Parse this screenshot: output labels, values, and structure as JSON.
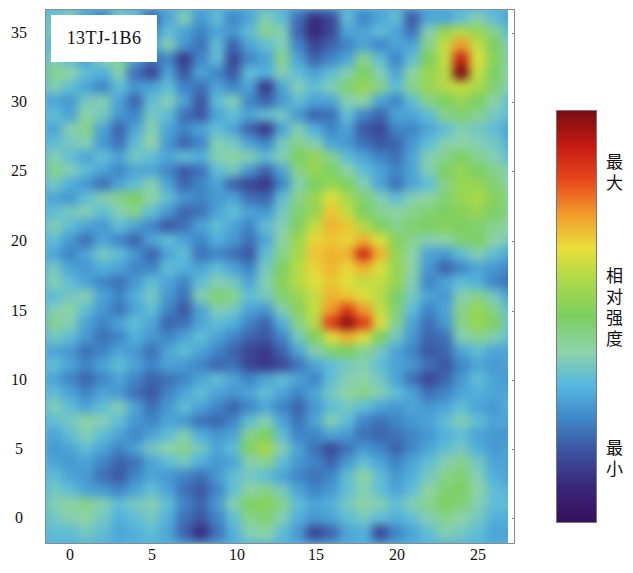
{
  "chart_data": {
    "type": "heatmap",
    "title": "13TJ-1B6",
    "xlabel": "",
    "ylabel": "",
    "x_ticks": [
      "0",
      "5",
      "10",
      "15",
      "20",
      "25"
    ],
    "y_ticks": [
      "35",
      "30",
      "25",
      "20",
      "15",
      "10",
      "5",
      "0"
    ],
    "xlim": [
      -1.5,
      26.8
    ],
    "ylim": [
      -1.8,
      36.7
    ],
    "grid": false,
    "colorbar": {
      "labels": [
        "最大",
        "相对强度",
        "最小"
      ],
      "max_label": "最大",
      "mid_label": "相对强度",
      "min_label": "最小",
      "colors": [
        "#7a0d12",
        "#c41a12",
        "#e8461a",
        "#f19a2c",
        "#e8e03a",
        "#a8d94a",
        "#7ccf62",
        "#8fd3a8",
        "#56b8e0",
        "#3f86c8",
        "#3b4f9e",
        "#3a2678",
        "#36105e"
      ]
    },
    "hotspots": [
      {
        "x": 17,
        "y": 17,
        "intensity": 0.95,
        "note": "main maximum"
      },
      {
        "x": 19,
        "y": 20,
        "intensity": 0.85
      },
      {
        "x": 25,
        "y": 31,
        "intensity": 1.0,
        "note": "top-right maximum"
      },
      {
        "x": 16.5,
        "y": 19.5,
        "intensity": 0.65,
        "note": "yellow-green halo region"
      }
    ],
    "grid_x_start": -1,
    "grid_y_start": 36,
    "grid_step": 1,
    "values": [
      [
        0.38,
        0.42,
        0.3,
        0.25,
        0.4,
        0.35,
        0.2,
        0.3,
        0.4,
        0.28,
        0.35,
        0.25,
        0.3,
        0.4,
        0.35,
        0.22,
        0.1,
        0.15,
        0.35,
        0.25,
        0.3,
        0.35,
        0.18,
        0.3,
        0.3,
        0.35,
        0.4,
        0.35,
        0.3
      ],
      [
        0.4,
        0.38,
        0.35,
        0.3,
        0.38,
        0.3,
        0.25,
        0.35,
        0.3,
        0.25,
        0.3,
        0.28,
        0.35,
        0.45,
        0.4,
        0.2,
        0.08,
        0.15,
        0.3,
        0.3,
        0.35,
        0.3,
        0.22,
        0.4,
        0.55,
        0.6,
        0.55,
        0.45,
        0.35
      ],
      [
        0.35,
        0.4,
        0.38,
        0.28,
        0.35,
        0.25,
        0.3,
        0.4,
        0.28,
        0.22,
        0.35,
        0.2,
        0.3,
        0.35,
        0.4,
        0.25,
        0.15,
        0.2,
        0.25,
        0.3,
        0.25,
        0.3,
        0.3,
        0.45,
        0.62,
        0.75,
        0.62,
        0.5,
        0.4
      ],
      [
        0.4,
        0.35,
        0.3,
        0.4,
        0.45,
        0.3,
        0.22,
        0.25,
        0.12,
        0.25,
        0.35,
        0.15,
        0.25,
        0.3,
        0.45,
        0.3,
        0.2,
        0.25,
        0.3,
        0.45,
        0.35,
        0.25,
        0.35,
        0.5,
        0.62,
        0.9,
        0.65,
        0.52,
        0.4
      ],
      [
        0.45,
        0.42,
        0.35,
        0.32,
        0.4,
        0.22,
        0.15,
        0.3,
        0.18,
        0.3,
        0.25,
        0.18,
        0.35,
        0.32,
        0.4,
        0.35,
        0.3,
        0.35,
        0.4,
        0.5,
        0.4,
        0.3,
        0.42,
        0.55,
        0.6,
        1.0,
        0.62,
        0.5,
        0.42
      ],
      [
        0.4,
        0.35,
        0.3,
        0.25,
        0.35,
        0.28,
        0.3,
        0.35,
        0.25,
        0.22,
        0.3,
        0.25,
        0.3,
        0.12,
        0.3,
        0.4,
        0.35,
        0.4,
        0.48,
        0.55,
        0.45,
        0.35,
        0.45,
        0.55,
        0.6,
        0.62,
        0.58,
        0.48,
        0.4
      ],
      [
        0.3,
        0.28,
        0.38,
        0.4,
        0.3,
        0.2,
        0.35,
        0.4,
        0.3,
        0.18,
        0.35,
        0.4,
        0.25,
        0.2,
        0.28,
        0.35,
        0.3,
        0.3,
        0.4,
        0.42,
        0.3,
        0.25,
        0.35,
        0.45,
        0.5,
        0.55,
        0.5,
        0.42,
        0.35
      ],
      [
        0.35,
        0.3,
        0.42,
        0.38,
        0.28,
        0.25,
        0.38,
        0.35,
        0.22,
        0.18,
        0.3,
        0.35,
        0.3,
        0.35,
        0.38,
        0.28,
        0.2,
        0.22,
        0.35,
        0.25,
        0.2,
        0.3,
        0.3,
        0.35,
        0.45,
        0.48,
        0.45,
        0.38,
        0.35
      ],
      [
        0.3,
        0.4,
        0.45,
        0.3,
        0.2,
        0.3,
        0.4,
        0.3,
        0.25,
        0.3,
        0.35,
        0.3,
        0.2,
        0.12,
        0.3,
        0.4,
        0.32,
        0.25,
        0.3,
        0.18,
        0.15,
        0.25,
        0.25,
        0.3,
        0.35,
        0.4,
        0.38,
        0.35,
        0.3
      ],
      [
        0.35,
        0.38,
        0.4,
        0.28,
        0.22,
        0.35,
        0.42,
        0.28,
        0.2,
        0.25,
        0.4,
        0.38,
        0.3,
        0.25,
        0.38,
        0.45,
        0.4,
        0.3,
        0.28,
        0.22,
        0.18,
        0.2,
        0.28,
        0.35,
        0.4,
        0.42,
        0.4,
        0.38,
        0.32
      ],
      [
        0.4,
        0.35,
        0.3,
        0.35,
        0.3,
        0.38,
        0.35,
        0.3,
        0.35,
        0.32,
        0.4,
        0.42,
        0.4,
        0.35,
        0.4,
        0.5,
        0.55,
        0.45,
        0.35,
        0.3,
        0.25,
        0.22,
        0.3,
        0.4,
        0.45,
        0.5,
        0.45,
        0.4,
        0.35
      ],
      [
        0.45,
        0.4,
        0.35,
        0.3,
        0.25,
        0.3,
        0.3,
        0.25,
        0.18,
        0.22,
        0.35,
        0.38,
        0.28,
        0.2,
        0.3,
        0.45,
        0.55,
        0.5,
        0.42,
        0.35,
        0.3,
        0.25,
        0.3,
        0.4,
        0.5,
        0.55,
        0.5,
        0.45,
        0.4
      ],
      [
        0.38,
        0.32,
        0.28,
        0.22,
        0.3,
        0.35,
        0.4,
        0.3,
        0.2,
        0.25,
        0.3,
        0.2,
        0.15,
        0.12,
        0.25,
        0.4,
        0.5,
        0.55,
        0.5,
        0.4,
        0.3,
        0.22,
        0.3,
        0.35,
        0.45,
        0.55,
        0.55,
        0.48,
        0.42
      ],
      [
        0.3,
        0.28,
        0.35,
        0.4,
        0.45,
        0.5,
        0.42,
        0.35,
        0.28,
        0.25,
        0.28,
        0.3,
        0.22,
        0.2,
        0.35,
        0.45,
        0.55,
        0.65,
        0.58,
        0.48,
        0.4,
        0.35,
        0.4,
        0.42,
        0.48,
        0.55,
        0.58,
        0.52,
        0.45
      ],
      [
        0.35,
        0.38,
        0.4,
        0.35,
        0.4,
        0.45,
        0.35,
        0.28,
        0.2,
        0.22,
        0.3,
        0.35,
        0.3,
        0.28,
        0.38,
        0.48,
        0.55,
        0.7,
        0.62,
        0.5,
        0.45,
        0.42,
        0.45,
        0.48,
        0.5,
        0.52,
        0.55,
        0.5,
        0.45
      ],
      [
        0.4,
        0.35,
        0.3,
        0.28,
        0.35,
        0.3,
        0.25,
        0.18,
        0.22,
        0.3,
        0.35,
        0.3,
        0.25,
        0.35,
        0.4,
        0.5,
        0.62,
        0.72,
        0.7,
        0.6,
        0.5,
        0.45,
        0.48,
        0.5,
        0.52,
        0.5,
        0.48,
        0.45,
        0.42
      ],
      [
        0.35,
        0.28,
        0.22,
        0.3,
        0.25,
        0.2,
        0.3,
        0.35,
        0.3,
        0.25,
        0.32,
        0.28,
        0.22,
        0.3,
        0.42,
        0.55,
        0.68,
        0.7,
        0.68,
        0.72,
        0.65,
        0.52,
        0.45,
        0.4,
        0.42,
        0.48,
        0.5,
        0.42,
        0.38
      ],
      [
        0.3,
        0.25,
        0.3,
        0.38,
        0.35,
        0.28,
        0.2,
        0.3,
        0.35,
        0.22,
        0.25,
        0.22,
        0.18,
        0.35,
        0.45,
        0.58,
        0.7,
        0.72,
        0.72,
        0.88,
        0.72,
        0.55,
        0.42,
        0.3,
        0.28,
        0.35,
        0.4,
        0.35,
        0.3
      ],
      [
        0.38,
        0.3,
        0.28,
        0.32,
        0.3,
        0.25,
        0.25,
        0.35,
        0.32,
        0.3,
        0.35,
        0.3,
        0.25,
        0.38,
        0.5,
        0.6,
        0.68,
        0.72,
        0.68,
        0.72,
        0.65,
        0.55,
        0.42,
        0.28,
        0.2,
        0.25,
        0.3,
        0.28,
        0.25
      ],
      [
        0.4,
        0.35,
        0.3,
        0.25,
        0.22,
        0.28,
        0.35,
        0.3,
        0.25,
        0.35,
        0.4,
        0.38,
        0.3,
        0.4,
        0.52,
        0.6,
        0.65,
        0.7,
        0.65,
        0.62,
        0.62,
        0.55,
        0.4,
        0.25,
        0.3,
        0.35,
        0.32,
        0.25,
        0.22
      ],
      [
        0.35,
        0.38,
        0.4,
        0.3,
        0.25,
        0.32,
        0.38,
        0.28,
        0.22,
        0.4,
        0.48,
        0.45,
        0.35,
        0.38,
        0.48,
        0.55,
        0.62,
        0.72,
        0.7,
        0.65,
        0.6,
        0.5,
        0.38,
        0.3,
        0.28,
        0.4,
        0.45,
        0.38,
        0.3
      ],
      [
        0.4,
        0.42,
        0.35,
        0.28,
        0.22,
        0.3,
        0.35,
        0.25,
        0.18,
        0.3,
        0.4,
        0.38,
        0.3,
        0.28,
        0.4,
        0.52,
        0.62,
        0.75,
        0.85,
        0.75,
        0.62,
        0.48,
        0.35,
        0.25,
        0.3,
        0.45,
        0.55,
        0.45,
        0.35
      ],
      [
        0.45,
        0.4,
        0.3,
        0.25,
        0.3,
        0.35,
        0.3,
        0.2,
        0.22,
        0.3,
        0.35,
        0.32,
        0.25,
        0.2,
        0.32,
        0.45,
        0.6,
        0.85,
        0.98,
        0.85,
        0.65,
        0.45,
        0.3,
        0.22,
        0.28,
        0.45,
        0.55,
        0.5,
        0.38
      ],
      [
        0.38,
        0.35,
        0.28,
        0.22,
        0.25,
        0.32,
        0.28,
        0.25,
        0.3,
        0.35,
        0.3,
        0.25,
        0.2,
        0.18,
        0.25,
        0.38,
        0.5,
        0.65,
        0.72,
        0.65,
        0.5,
        0.38,
        0.28,
        0.2,
        0.22,
        0.4,
        0.45,
        0.4,
        0.35
      ],
      [
        0.3,
        0.28,
        0.22,
        0.25,
        0.3,
        0.28,
        0.22,
        0.3,
        0.35,
        0.3,
        0.25,
        0.2,
        0.15,
        0.12,
        0.2,
        0.3,
        0.4,
        0.48,
        0.5,
        0.45,
        0.38,
        0.3,
        0.25,
        0.18,
        0.2,
        0.3,
        0.35,
        0.3,
        0.3
      ],
      [
        0.35,
        0.3,
        0.25,
        0.3,
        0.35,
        0.3,
        0.25,
        0.3,
        0.28,
        0.25,
        0.2,
        0.22,
        0.15,
        0.12,
        0.15,
        0.22,
        0.3,
        0.35,
        0.38,
        0.4,
        0.35,
        0.3,
        0.28,
        0.22,
        0.18,
        0.25,
        0.3,
        0.28,
        0.3
      ],
      [
        0.3,
        0.25,
        0.2,
        0.25,
        0.3,
        0.25,
        0.2,
        0.22,
        0.25,
        0.3,
        0.35,
        0.3,
        0.25,
        0.3,
        0.35,
        0.3,
        0.25,
        0.35,
        0.4,
        0.42,
        0.38,
        0.3,
        0.22,
        0.15,
        0.2,
        0.28,
        0.35,
        0.3,
        0.28
      ],
      [
        0.35,
        0.3,
        0.25,
        0.3,
        0.28,
        0.22,
        0.18,
        0.25,
        0.3,
        0.35,
        0.3,
        0.28,
        0.3,
        0.35,
        0.3,
        0.25,
        0.3,
        0.38,
        0.42,
        0.45,
        0.4,
        0.35,
        0.3,
        0.22,
        0.25,
        0.3,
        0.32,
        0.3,
        0.3
      ],
      [
        0.4,
        0.35,
        0.3,
        0.35,
        0.4,
        0.3,
        0.22,
        0.28,
        0.35,
        0.3,
        0.25,
        0.2,
        0.25,
        0.3,
        0.25,
        0.2,
        0.28,
        0.35,
        0.38,
        0.35,
        0.3,
        0.28,
        0.3,
        0.28,
        0.3,
        0.35,
        0.3,
        0.28,
        0.32
      ],
      [
        0.35,
        0.38,
        0.42,
        0.4,
        0.35,
        0.28,
        0.25,
        0.3,
        0.28,
        0.22,
        0.2,
        0.25,
        0.35,
        0.4,
        0.3,
        0.22,
        0.3,
        0.4,
        0.35,
        0.25,
        0.22,
        0.25,
        0.28,
        0.3,
        0.35,
        0.4,
        0.35,
        0.3,
        0.3
      ],
      [
        0.3,
        0.35,
        0.4,
        0.35,
        0.3,
        0.25,
        0.3,
        0.35,
        0.4,
        0.32,
        0.28,
        0.3,
        0.45,
        0.5,
        0.35,
        0.25,
        0.25,
        0.3,
        0.28,
        0.22,
        0.2,
        0.22,
        0.25,
        0.28,
        0.32,
        0.35,
        0.3,
        0.28,
        0.28
      ],
      [
        0.28,
        0.3,
        0.35,
        0.3,
        0.25,
        0.3,
        0.38,
        0.42,
        0.45,
        0.38,
        0.3,
        0.35,
        0.5,
        0.58,
        0.4,
        0.3,
        0.22,
        0.15,
        0.22,
        0.28,
        0.25,
        0.2,
        0.25,
        0.3,
        0.35,
        0.38,
        0.32,
        0.28,
        0.3
      ],
      [
        0.3,
        0.28,
        0.3,
        0.25,
        0.2,
        0.22,
        0.3,
        0.35,
        0.38,
        0.32,
        0.28,
        0.3,
        0.4,
        0.45,
        0.35,
        0.28,
        0.25,
        0.2,
        0.28,
        0.35,
        0.3,
        0.25,
        0.3,
        0.35,
        0.4,
        0.45,
        0.38,
        0.3,
        0.3
      ],
      [
        0.35,
        0.3,
        0.28,
        0.22,
        0.18,
        0.25,
        0.3,
        0.28,
        0.25,
        0.22,
        0.28,
        0.35,
        0.38,
        0.35,
        0.3,
        0.25,
        0.22,
        0.25,
        0.35,
        0.42,
        0.35,
        0.28,
        0.32,
        0.38,
        0.45,
        0.48,
        0.4,
        0.32,
        0.3
      ],
      [
        0.38,
        0.35,
        0.3,
        0.28,
        0.25,
        0.3,
        0.35,
        0.3,
        0.22,
        0.18,
        0.25,
        0.35,
        0.42,
        0.45,
        0.38,
        0.3,
        0.25,
        0.28,
        0.35,
        0.4,
        0.35,
        0.3,
        0.35,
        0.42,
        0.48,
        0.5,
        0.42,
        0.35,
        0.32
      ],
      [
        0.4,
        0.42,
        0.45,
        0.4,
        0.35,
        0.38,
        0.4,
        0.35,
        0.25,
        0.2,
        0.28,
        0.4,
        0.5,
        0.52,
        0.45,
        0.35,
        0.3,
        0.32,
        0.38,
        0.42,
        0.4,
        0.35,
        0.4,
        0.45,
        0.5,
        0.48,
        0.4,
        0.35,
        0.35
      ],
      [
        0.38,
        0.4,
        0.42,
        0.38,
        0.32,
        0.35,
        0.38,
        0.32,
        0.22,
        0.18,
        0.25,
        0.35,
        0.45,
        0.48,
        0.4,
        0.32,
        0.28,
        0.3,
        0.35,
        0.38,
        0.35,
        0.32,
        0.35,
        0.4,
        0.45,
        0.42,
        0.38,
        0.32,
        0.32
      ],
      [
        0.35,
        0.35,
        0.38,
        0.35,
        0.3,
        0.32,
        0.35,
        0.3,
        0.2,
        0.1,
        0.22,
        0.32,
        0.4,
        0.42,
        0.35,
        0.28,
        0.15,
        0.2,
        0.3,
        0.32,
        0.15,
        0.25,
        0.3,
        0.35,
        0.4,
        0.38,
        0.35,
        0.3,
        0.3
      ]
    ]
  },
  "plot": {
    "sample_label": "13TJ-1B6"
  },
  "colorbar": {
    "max_label": "最大",
    "mid_label": "相对强度",
    "min_label": "最小"
  },
  "axes": {
    "x_ticks": [
      {
        "label": "0",
        "pos": 70
      },
      {
        "label": "5",
        "pos": 152
      },
      {
        "label": "10",
        "pos": 237
      },
      {
        "label": "15",
        "pos": 316
      },
      {
        "label": "20",
        "pos": 397
      },
      {
        "label": "25",
        "pos": 478
      }
    ],
    "y_ticks": [
      {
        "label": "35",
        "pos": 33
      },
      {
        "label": "30",
        "pos": 102
      },
      {
        "label": "25",
        "pos": 171
      },
      {
        "label": "20",
        "pos": 241
      },
      {
        "label": "15",
        "pos": 311
      },
      {
        "label": "10",
        "pos": 380
      },
      {
        "label": "5",
        "pos": 449
      },
      {
        "label": "0",
        "pos": 518
      }
    ]
  }
}
